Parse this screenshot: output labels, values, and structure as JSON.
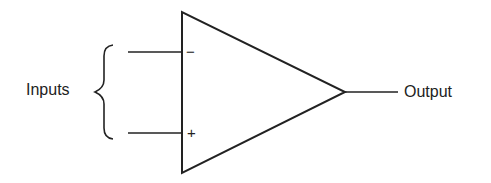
{
  "diagram": {
    "type": "op-amp symbol",
    "labels": {
      "inputs": "Inputs",
      "output": "Output",
      "inverting": "−",
      "non_inverting": "+"
    },
    "colors": {
      "stroke": "#222222",
      "background": "#ffffff"
    }
  }
}
